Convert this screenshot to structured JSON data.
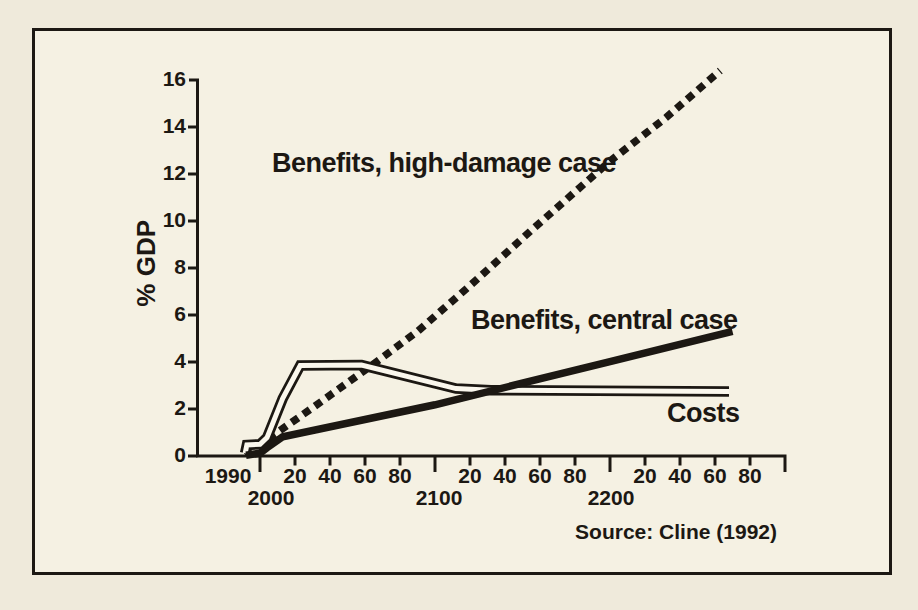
{
  "figure": {
    "annotations": {
      "high_damage": "Benefits, high-damage case",
      "central": "Benefits, central case",
      "costs": "Costs"
    },
    "source": "Source: Cline (1992)",
    "y_axis": {
      "title": "% GDP",
      "tick_labels": [
        "16",
        "14",
        "12",
        "10",
        "8",
        "6",
        "4",
        "2",
        "0"
      ]
    },
    "x_axis": {
      "first_label": "1990",
      "century_labels": [
        "2000",
        "2100",
        "2200"
      ],
      "minor_labels": [
        "20",
        "40",
        "60",
        "80"
      ]
    },
    "colors": {
      "ink": "#1c1813",
      "paper": "#f5f1e3",
      "costs_fill": "#faf7ed"
    }
  },
  "chart_data": {
    "type": "line",
    "title": "",
    "xlabel": "Year",
    "ylabel": "% GDP",
    "x_range": [
      1990,
      2300
    ],
    "y_range": [
      0,
      16
    ],
    "x_major_ticks": [
      2000,
      2100,
      2200,
      2300
    ],
    "x_minor_tick_step": 20,
    "y_tick_step": 2,
    "grid": false,
    "legend_position": "inline-annotations",
    "source": "Cline (1992)",
    "series": [
      {
        "id": "high_damage",
        "name": "Benefits, high-damage case",
        "style": "dashed",
        "points": [
          [
            1991,
            0.1
          ],
          [
            2005,
            0.75
          ],
          [
            2030,
            2.05
          ],
          [
            2060,
            3.65
          ],
          [
            2090,
            5.3
          ],
          [
            2120,
            7.25
          ],
          [
            2155,
            9.6
          ],
          [
            2200,
            12.55
          ],
          [
            2232,
            14.4
          ],
          [
            2263,
            16.4
          ]
        ]
      },
      {
        "id": "central",
        "name": "Benefits, central case",
        "style": "solid-thick",
        "points": [
          [
            1992,
            0.03
          ],
          [
            2000,
            0.12
          ],
          [
            2004,
            0.35
          ],
          [
            2013,
            0.82
          ],
          [
            2100,
            2.18
          ],
          [
            2200,
            4.02
          ],
          [
            2270,
            5.3
          ]
        ]
      },
      {
        "id": "costs",
        "name": "Costs",
        "style": "outlined-white",
        "points": [
          [
            1991.5,
            0.12
          ],
          [
            1992.5,
            0.47
          ],
          [
            2000,
            0.5
          ],
          [
            2004,
            0.78
          ],
          [
            2013,
            2.45
          ],
          [
            2023,
            3.85
          ],
          [
            2058,
            3.87
          ],
          [
            2112,
            2.87
          ],
          [
            2132,
            2.8
          ],
          [
            2268,
            2.74
          ]
        ]
      }
    ]
  }
}
